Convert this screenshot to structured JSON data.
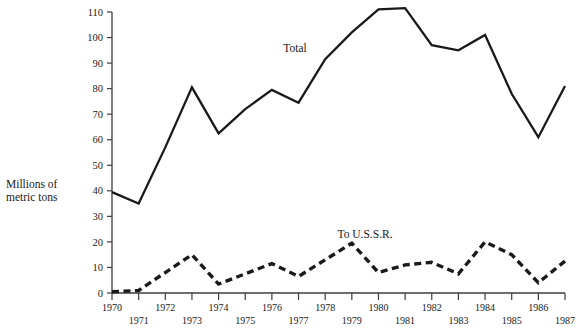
{
  "chart_data": {
    "type": "line",
    "title": "",
    "xlabel": "",
    "ylabel": "Millions of metric tons",
    "ylabel_line1": "Millions of",
    "ylabel_line2": "metric tons",
    "xlim": [
      1970,
      1987
    ],
    "ylim": [
      0,
      110
    ],
    "grid": false,
    "legend_position": "inline-annotation",
    "x": [
      1970,
      1971,
      1972,
      1973,
      1974,
      1975,
      1976,
      1977,
      1978,
      1979,
      1980,
      1981,
      1982,
      1983,
      1984,
      1985,
      1986,
      1987
    ],
    "ytick_values": [
      0,
      10,
      20,
      30,
      40,
      50,
      60,
      70,
      80,
      90,
      100,
      110
    ],
    "ytick_labels": [
      "0",
      "10",
      "20",
      "30",
      "40",
      "50",
      "60",
      "70",
      "80",
      "90",
      "100",
      "110"
    ],
    "xtick_labels": [
      "1970",
      "1971",
      "1972",
      "1973",
      "1974",
      "1975",
      "1976",
      "1977",
      "1978",
      "1979",
      "1980",
      "1981",
      "1982",
      "1983",
      "1984",
      "1985",
      "1986",
      "1987"
    ],
    "series": [
      {
        "name": "Total",
        "style": "solid",
        "color": "#1a1a1a",
        "values": [
          39.5,
          35.0,
          57.0,
          80.5,
          62.5,
          72.0,
          79.5,
          74.5,
          91.5,
          102.0,
          111.0,
          111.5,
          97.0,
          95.0,
          101.0,
          78.0,
          61.0,
          81.0
        ]
      },
      {
        "name": "To U.S.S.R.",
        "style": "dashed",
        "color": "#1a1a1a",
        "values": [
          0.5,
          1.0,
          8.0,
          15.0,
          3.5,
          7.5,
          11.5,
          6.5,
          13.0,
          19.5,
          8.0,
          11.0,
          12.0,
          7.5,
          20.0,
          15.0,
          4.0,
          12.5
        ]
      }
    ],
    "annotations": [
      {
        "text": "Total",
        "x_px": 295,
        "y_px": 52
      },
      {
        "text": "To U.S.S.R.",
        "x_px": 365,
        "y_px": 238
      }
    ]
  },
  "axis": {
    "y_axis_name": "y-axis",
    "x_axis_name": "x-axis"
  }
}
